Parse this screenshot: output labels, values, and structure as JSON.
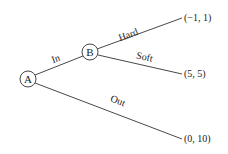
{
  "nodes": [
    {
      "id": "A",
      "label": "A",
      "cx": 28,
      "cy": 79
    },
    {
      "id": "B",
      "label": "B",
      "cx": 90,
      "cy": 52
    }
  ],
  "edges": [
    {
      "label": "In",
      "from": "A",
      "to": "B"
    },
    {
      "label": "Hard",
      "from": "B",
      "to": "payoff_hard"
    },
    {
      "label": "Soft",
      "from": "B",
      "to": "payoff_soft"
    },
    {
      "label": "Out",
      "from": "A",
      "to": "payoff_out"
    }
  ],
  "payoffs": {
    "hard": "(−1, 1)",
    "soft": "(5, 5)",
    "out": "(0, 10)"
  },
  "colors": {
    "line": "#333333",
    "text": "#222222"
  }
}
